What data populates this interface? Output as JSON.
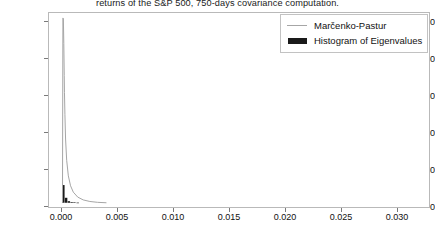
{
  "chart_data": {
    "type": "line",
    "title": "returns of the S&P 500, 750-days covariance computation.",
    "xlabel": "",
    "ylabel": "",
    "xlim": [
      -0.0012,
      0.0332
    ],
    "ylim": [
      -60,
      2680
    ],
    "grid": false,
    "legend_position": "upper right",
    "xticks": [
      0.0,
      0.005,
      0.01,
      0.015,
      0.02,
      0.025,
      0.03
    ],
    "xtick_labels": [
      "0.000",
      "0.005",
      "0.010",
      "0.015",
      "0.020",
      "0.025",
      "0.030"
    ],
    "yticks": [
      0,
      500,
      1000,
      1500,
      2000,
      2500
    ],
    "ytick_labels": [
      "0",
      "500",
      "1000",
      "1500",
      "2000",
      "2500"
    ],
    "series": [
      {
        "name": "Marčenko-Pastur",
        "type": "line",
        "color": "#a6a6a6",
        "x": [
          2e-05,
          6e-05,
          0.0001,
          0.00014,
          0.00018,
          0.0002,
          0.00024,
          0.0003,
          0.0004,
          0.00055,
          0.00075,
          0.001,
          0.0014,
          0.0019,
          0.0025,
          0.0032,
          0.004
        ],
        "y": [
          0,
          2610,
          2600,
          2250,
          1800,
          1560,
          1250,
          900,
          600,
          380,
          240,
          150,
          80,
          40,
          18,
          6,
          0
        ]
      },
      {
        "name": "Histogram of Eigenvalues",
        "type": "bar",
        "color": "#1a1a1a",
        "x": [
          0.0001,
          0.00035,
          0.0006,
          0.00085,
          0.0011,
          0.0014
        ],
        "y": [
          250,
          70,
          22,
          10,
          5,
          2
        ],
        "bar_width": 0.00022
      }
    ]
  },
  "legend": {
    "entries": [
      {
        "label": "Marčenko-Pastur",
        "marker": "line-swatch",
        "color": "#a6a6a6"
      },
      {
        "label": "Histogram of Eigenvalues",
        "marker": "bar-swatch",
        "color": "#1a1a1a"
      }
    ]
  },
  "axes": {
    "ytick_labels": [
      "2500",
      "2000",
      "1500",
      "1000",
      "500",
      "0"
    ],
    "xtick_labels": [
      "0.000",
      "0.005",
      "0.010",
      "0.015",
      "0.020",
      "0.025",
      "0.030"
    ]
  },
  "colors": {
    "mp_line": "#a6a6a6",
    "histogram": "#1a1a1a",
    "frame": "#b9b9b9",
    "text": "#111111",
    "background": "#ffffff"
  }
}
